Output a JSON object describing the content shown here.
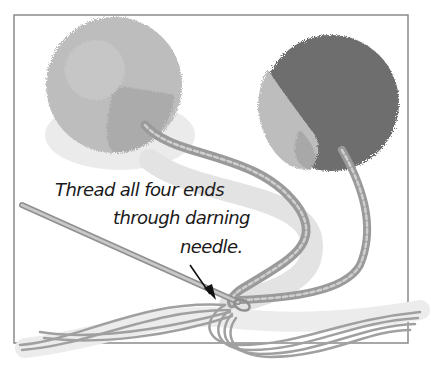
{
  "illustration": {
    "subject": "Two pom-poms with cords; ends threaded through a darning needle",
    "caption": {
      "line1": "Thread all four ends",
      "line2": "through darning",
      "line3": "needle."
    },
    "colors": {
      "background": "#ffffff",
      "frame": "#8a8a8a",
      "pompom_light": "#bdbdbd",
      "pompom_mid": "#a9a9a9",
      "pompom_dark": "#6e6e6e",
      "cord": "#9a9a9a",
      "cord_highlight": "#cfcfcf",
      "needle": "#b8b8b8",
      "caption_text": "#1a1a1a",
      "arrow": "#111111"
    }
  }
}
